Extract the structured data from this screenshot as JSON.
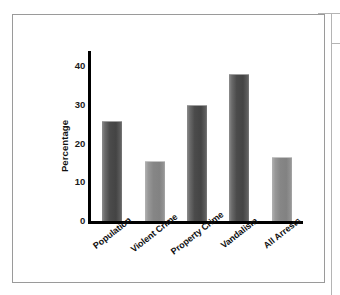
{
  "chart_data": {
    "type": "bar",
    "title": "",
    "subtitle": "",
    "xlabel": "",
    "ylabel": "Percentage",
    "categories": [
      "Population",
      "Violent Crime",
      "Property Crime",
      "Vandalism",
      "All Arrests"
    ],
    "values": [
      26,
      15.5,
      30,
      38,
      16.5
    ],
    "series": [
      {
        "name": "Percentage",
        "values": [
          26,
          15.5,
          30,
          38,
          16.5
        ]
      }
    ],
    "ylim": [
      0,
      44
    ],
    "yticks": [
      0,
      10,
      20,
      30,
      40
    ],
    "ytick_labels": [
      "0",
      "10",
      "20",
      "30",
      "40"
    ],
    "grid": false,
    "legend": false,
    "legend_position": "none",
    "bar_colors": [
      "#4b4b4b",
      "#868686",
      "#4b4b4b",
      "#4b4b4b",
      "#868686"
    ],
    "annotations": [],
    "axis_color": "#000000",
    "background": "#ffffff",
    "label_rotation": -38
  },
  "figure": {
    "border_color": "#9a9a9a",
    "frame_color": "#b4b4b4"
  }
}
